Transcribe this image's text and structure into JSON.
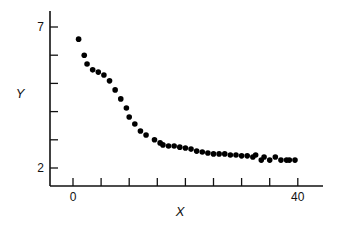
{
  "chart_data": {
    "type": "scatter",
    "title": "",
    "xlabel": "X",
    "ylabel": "Y",
    "xlim": [
      -4,
      45
    ],
    "ylim": [
      1.4,
      7.5
    ],
    "x_ticks": [
      0,
      5,
      10,
      15,
      20,
      25,
      30,
      35,
      40
    ],
    "x_tick_labels": [
      "0",
      "",
      "",
      "",
      "",
      "",
      "",
      "",
      "40"
    ],
    "y_ticks": [
      2,
      3,
      4,
      5,
      6,
      7
    ],
    "y_tick_labels": [
      "2",
      "",
      "",
      "",
      "",
      "7"
    ],
    "grid": false,
    "legend": null,
    "series": [
      {
        "name": "Y",
        "marker": "filled-circle",
        "color": "#000000",
        "x": [
          1,
          2,
          2.5,
          3.5,
          4.5,
          5.5,
          6.5,
          7.5,
          8.5,
          9.5,
          10,
          11,
          12,
          13,
          14.5,
          15.5,
          16,
          17,
          18,
          19,
          20,
          21,
          22,
          23,
          24,
          25,
          26,
          27,
          28,
          29,
          30,
          31,
          32,
          32.5,
          33.5,
          34,
          35,
          36,
          37,
          38,
          38.5,
          39.5
        ],
        "y": [
          6.57,
          6.0,
          5.69,
          5.48,
          5.4,
          5.3,
          5.09,
          4.77,
          4.45,
          4.13,
          3.81,
          3.56,
          3.31,
          3.17,
          3.0,
          2.89,
          2.82,
          2.78,
          2.78,
          2.74,
          2.71,
          2.67,
          2.6,
          2.57,
          2.53,
          2.5,
          2.5,
          2.5,
          2.46,
          2.46,
          2.43,
          2.43,
          2.39,
          2.46,
          2.28,
          2.39,
          2.28,
          2.39,
          2.28,
          2.28,
          2.28,
          2.28
        ]
      }
    ]
  }
}
